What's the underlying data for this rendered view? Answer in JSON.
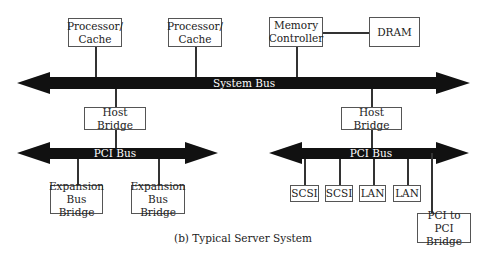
{
  "caption": "(b) Typical Server System",
  "buses": {
    "system": "System Bus",
    "pci_left": "PCI Bus",
    "pci_right": "PCI Bus"
  },
  "components": {
    "processor1": [
      "Processor/",
      "Cache"
    ],
    "processor2": [
      "Processor/",
      "Cache"
    ],
    "memory_controller": [
      "Memory",
      "Controller"
    ],
    "dram": "DRAM",
    "host_bridge_left": "Host Bridge",
    "host_bridge_right": "Host Bridge",
    "expansion1": [
      "Expansion",
      "Bus Bridge"
    ],
    "expansion2": [
      "Expansion",
      "Bus Bridge"
    ],
    "scsi1": "SCSI",
    "scsi2": "SCSI",
    "lan1": "LAN",
    "lan2": "LAN",
    "pci_to_pci": [
      "PCI to PCI",
      "Bridge"
    ]
  },
  "colors": {
    "bus": "#111111",
    "line": "#333333",
    "border": "#555555"
  }
}
